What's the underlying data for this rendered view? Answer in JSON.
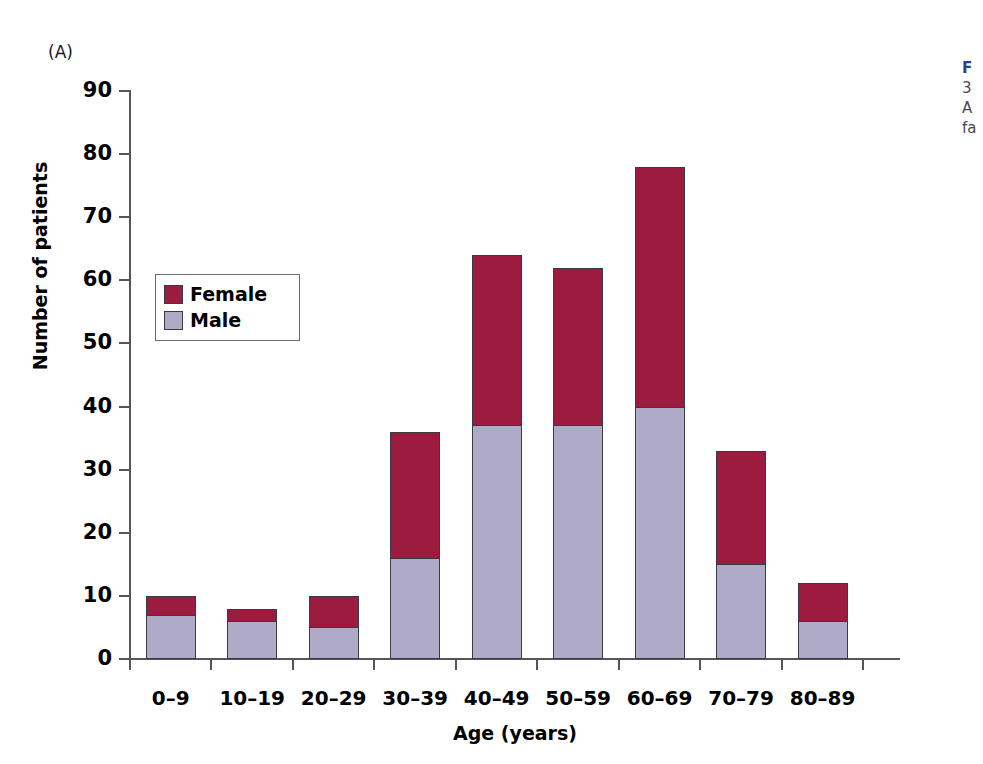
{
  "panel": {
    "label": "(A)"
  },
  "legend": {
    "items": [
      {
        "label": "Female",
        "color": "#9c1b3e"
      },
      {
        "label": "Male",
        "color": "#b0aac9"
      }
    ]
  },
  "caption": {
    "head": "F",
    "lines": [
      "3",
      "A",
      "fa"
    ]
  },
  "chart_data": {
    "type": "bar",
    "subtype": "stacked-vertical",
    "title": "",
    "xlabel": "Age (years)",
    "ylabel": "Number of patients",
    "categories": [
      "0–9",
      "10–19",
      "20–29",
      "30–39",
      "40–49",
      "50–59",
      "60–69",
      "70–79",
      "80–89"
    ],
    "series": [
      {
        "name": "Male",
        "color": "#b0aac9",
        "values": [
          7,
          6,
          5,
          16,
          37,
          37,
          40,
          15,
          6
        ]
      },
      {
        "name": "Female",
        "color": "#9c1b3e",
        "values": [
          3,
          2,
          5,
          20,
          27,
          25,
          38,
          18,
          6
        ]
      }
    ],
    "totals": [
      10,
      8,
      10,
      36,
      64,
      62,
      78,
      33,
      12
    ],
    "ylim": [
      0,
      90
    ],
    "ytick_step": 10,
    "yticks": [
      0,
      10,
      20,
      30,
      40,
      50,
      60,
      70,
      80,
      90
    ],
    "grid": false,
    "legend_position": "inside-upper-left"
  }
}
